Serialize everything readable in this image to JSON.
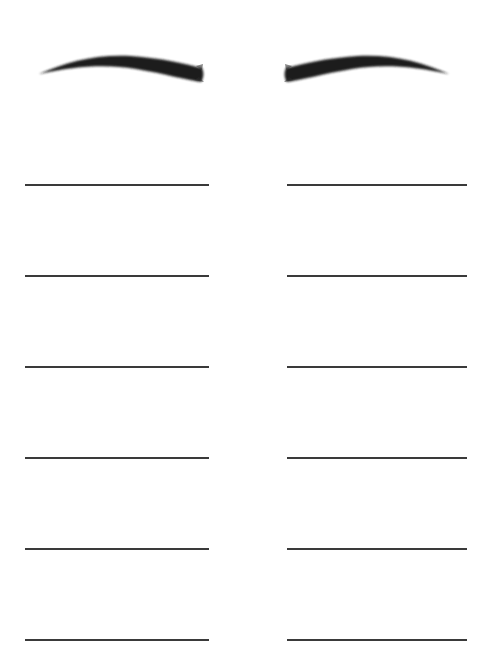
{
  "worksheet": {
    "type": "eyebrow practice sheet",
    "background_color": "#ffffff",
    "eyebrows": [
      {
        "side": "left",
        "icon": "eyebrow-left-icon",
        "color": "#1f1f1f"
      },
      {
        "side": "right",
        "icon": "eyebrow-right-icon",
        "color": "#1f1f1f"
      }
    ],
    "columns": [
      {
        "side": "left",
        "line_count": 6
      },
      {
        "side": "right",
        "line_count": 6
      }
    ],
    "line_color": "#3a3a3a"
  }
}
